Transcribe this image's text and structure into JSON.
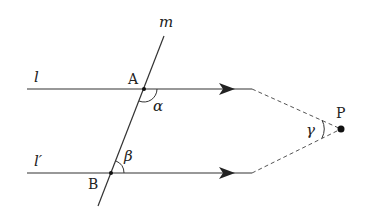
{
  "diagram": {
    "lines": {
      "l": "l",
      "l_prime": "l′",
      "m": "m"
    },
    "points": {
      "A": "A",
      "B": "B",
      "P": "P"
    },
    "angles": {
      "alpha": "α",
      "beta": "β",
      "gamma": "γ"
    },
    "colors": {
      "ink": "#222222",
      "background": "#ffffff"
    }
  }
}
